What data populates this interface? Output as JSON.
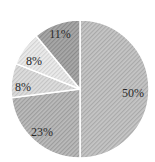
{
  "chart_data": {
    "type": "pie",
    "title": "",
    "start_angle_deg": 0,
    "direction": "clockwise",
    "slices": [
      {
        "label": "50%",
        "value": 50,
        "color": "#c6c6c6",
        "hatch": "#a9a9a9",
        "label_pos": [
          133,
          94
        ]
      },
      {
        "label": "23%",
        "value": 23,
        "color": "#bcbcbc",
        "hatch": "#9c9c9c",
        "label_pos": [
          42,
          133
        ]
      },
      {
        "label": "8%",
        "value": 8,
        "color": "#dedede",
        "hatch": "#c4c4c4",
        "label_pos": [
          23,
          88
        ]
      },
      {
        "label": "8%",
        "value": 8,
        "color": "#ececec",
        "hatch": "#d2d2d2",
        "label_pos": [
          34,
          62
        ]
      },
      {
        "label": "11%",
        "value": 11,
        "color": "#a9a9a9",
        "hatch": "#8b8b8b",
        "label_pos": [
          60,
          35
        ]
      }
    ],
    "center": [
      80,
      89
    ],
    "radius": 69,
    "legend": null
  }
}
